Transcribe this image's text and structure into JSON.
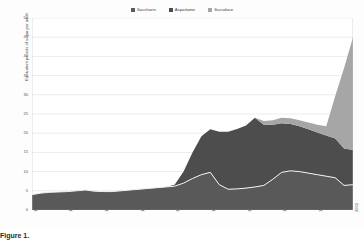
{
  "chart_data": {
    "type": "area",
    "stacked": true,
    "title": "",
    "subtitle": "",
    "xlabel": "",
    "ylabel": "Equivalent pounds of sugar per adult",
    "ylim": [
      0,
      50
    ],
    "ytick_step": 5,
    "yticks": [
      0,
      5,
      10,
      15,
      20,
      25,
      30,
      35,
      40,
      45,
      50
    ],
    "grid": true,
    "legend_position": "top-center",
    "xlim": [
      1966,
      2002
    ],
    "xticks": [
      1966,
      1970,
      1974,
      1978,
      1982,
      1986,
      1990,
      1994,
      1998,
      2002
    ],
    "x": [
      1966,
      1967,
      1968,
      1969,
      1970,
      1971,
      1972,
      1973,
      1974,
      1975,
      1976,
      1977,
      1978,
      1979,
      1980,
      1981,
      1982,
      1983,
      1984,
      1985,
      1986,
      1987,
      1988,
      1989,
      1990,
      1991,
      1992,
      1993,
      1994,
      1995,
      1996,
      1997,
      1998,
      1999,
      2000,
      2001,
      2002
    ],
    "series": [
      {
        "name": "Saccharin",
        "color": "#595959",
        "outline_color": "#f2f2f2",
        "values": [
          4.0,
          4.4,
          4.6,
          4.7,
          4.8,
          5.0,
          5.2,
          4.9,
          4.8,
          4.8,
          5.0,
          5.2,
          5.4,
          5.6,
          5.8,
          6.0,
          6.2,
          7.0,
          8.2,
          9.2,
          9.8,
          6.6,
          5.4,
          5.5,
          5.7,
          6.0,
          6.4,
          8.0,
          9.8,
          10.2,
          10.0,
          9.6,
          9.2,
          8.8,
          8.4,
          6.4,
          6.6
        ]
      },
      {
        "name": "Aspartame",
        "color": "#4d4d4d",
        "values": [
          0,
          0,
          0,
          0,
          0,
          0,
          0,
          0,
          0,
          0,
          0,
          0,
          0,
          0,
          0,
          0,
          0.4,
          3.0,
          6.8,
          10.0,
          11.2,
          13.8,
          15.0,
          15.6,
          16.3,
          18.0,
          15.8,
          14.2,
          12.8,
          12.2,
          11.8,
          11.4,
          11.0,
          10.6,
          10.2,
          9.6,
          9.0
        ]
      },
      {
        "name": "Sucralose",
        "color": "#a6a6a6",
        "values": [
          0,
          0,
          0,
          0,
          0,
          0,
          0,
          0,
          0,
          0,
          0,
          0,
          0,
          0,
          0,
          0,
          0,
          0,
          0,
          0,
          0,
          0,
          0,
          0,
          0,
          0,
          1.0,
          1.2,
          1.4,
          1.5,
          1.6,
          1.8,
          2.0,
          2.4,
          11.0,
          21.0,
          29.4
        ]
      }
    ],
    "totals": [
      4.0,
      4.4,
      4.6,
      4.7,
      4.8,
      5.0,
      5.2,
      4.9,
      4.8,
      4.8,
      5.0,
      5.2,
      5.4,
      5.6,
      5.8,
      6.0,
      6.6,
      10.0,
      15.0,
      19.2,
      21.0,
      20.4,
      20.4,
      21.1,
      22.0,
      24.0,
      23.2,
      23.4,
      24.0,
      23.9,
      23.4,
      22.8,
      22.2,
      21.8,
      29.6,
      37.0,
      45.0
    ],
    "annotations": []
  },
  "legend": {
    "items": [
      {
        "label": "Saccharin",
        "color": "#595959"
      },
      {
        "label": "Aspartame",
        "color": "#4d4d4d"
      },
      {
        "label": "Sucralose",
        "color": "#a6a6a6"
      }
    ]
  },
  "axes": {
    "y_title": "Equivalent pounds of sugar per adult",
    "y_labels": [
      "50",
      "45",
      "40",
      "35",
      "30",
      "25",
      "20",
      "15",
      "10",
      "5",
      "0"
    ],
    "x_labels": [
      "1966",
      "1970",
      "1974",
      "1978",
      "1982",
      "1986",
      "1990",
      "1994",
      "1998",
      "2002"
    ]
  },
  "caption": {
    "text": "Figure 1."
  }
}
